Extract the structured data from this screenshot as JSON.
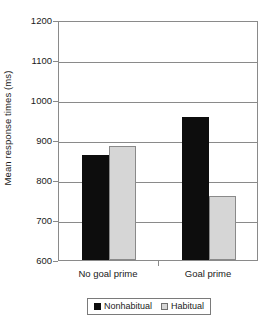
{
  "chart_data": {
    "type": "bar",
    "title": "",
    "xlabel": "",
    "ylabel": "Mean response times (ms)",
    "categories": [
      "No goal prime",
      "Goal prime"
    ],
    "series": [
      {
        "name": "Nonhabitual",
        "color": "#0d0d0d",
        "values": [
          863,
          958
        ]
      },
      {
        "name": "Habitual",
        "color": "#d6d6d6",
        "values": [
          885,
          760
        ]
      }
    ],
    "ylim": [
      600,
      1200
    ],
    "ytick_step": 100,
    "yticks": [
      "1200",
      "1100",
      "1000",
      "900",
      "800",
      "700",
      "600"
    ],
    "grid": true,
    "legend_position": "bottom"
  },
  "legend": {
    "entries": [
      {
        "label": "Nonhabitual",
        "swatch": "black-square-icon"
      },
      {
        "label": "Habitual",
        "swatch": "gray-square-icon"
      }
    ]
  }
}
